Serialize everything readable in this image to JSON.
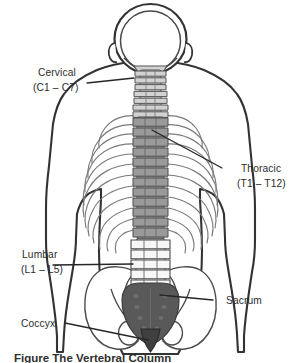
{
  "figure": {
    "title": "The Vertebral Column",
    "view": "posterior view of human torso skeleton",
    "caption": "Figure  The Vertebral Column"
  },
  "labels": {
    "cervical": {
      "name": "Cervical",
      "range": "(C1 – C7)"
    },
    "thoracic": {
      "name": "Thoracic",
      "range": "(T1 – T12)"
    },
    "lumbar": {
      "name": "Lumbar",
      "range": "(L1 – L5)"
    },
    "sacrum": {
      "name": "Sacrum",
      "range": ""
    },
    "coccyx": {
      "name": "Coccyx",
      "range": ""
    }
  },
  "colors": {
    "outline": "#2b2b2b",
    "body_outline": "#3a3a3a",
    "bone_outline": "#555555",
    "cervical_fill": "#d2d2d2",
    "thoracic_fill": "#9a9a9a",
    "lumbar_fill": "#f2f2f2",
    "sacrum_fill": "#595959",
    "coccyx_fill": "#3f3f3f",
    "rib_stroke": "#6e6e6e",
    "pelvis_fill": "#ffffff",
    "background": "#ffffff",
    "leader_line": "#262626",
    "text": "#2b2b2b"
  },
  "regions": [
    {
      "id": "cervical",
      "label": "Cervical",
      "range": "(C1 – C7)",
      "vertebrae": 7,
      "shade": "light-gray"
    },
    {
      "id": "thoracic",
      "label": "Thoracic",
      "range": "(T1 – T12)",
      "vertebrae": 12,
      "shade": "medium-gray"
    },
    {
      "id": "lumbar",
      "label": "Lumbar",
      "range": "(L1 – L5)",
      "vertebrae": 5,
      "shade": "white"
    },
    {
      "id": "sacrum",
      "label": "Sacrum",
      "range": "",
      "vertebrae": 5,
      "shade": "dark-gray"
    },
    {
      "id": "coccyx",
      "label": "Coccyx",
      "range": "",
      "vertebrae": 4,
      "shade": "darkest-gray"
    }
  ]
}
